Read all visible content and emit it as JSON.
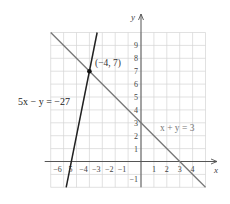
{
  "chart_data": {
    "type": "line",
    "title": "",
    "xlabel": "x",
    "ylabel": "y",
    "xlim": [
      -7,
      5
    ],
    "ylim": [
      -2,
      10
    ],
    "grid": true,
    "x_ticks": [
      -6,
      -5,
      -4,
      -3,
      -2,
      -1,
      1,
      2,
      3,
      4
    ],
    "x_tick_labels": [
      "-6",
      "5",
      "-4",
      "-3",
      "-2",
      "-1",
      "1",
      "2",
      "3",
      "4"
    ],
    "y_ticks": [
      -1,
      1,
      2,
      3,
      4,
      5,
      6,
      7,
      8,
      9
    ],
    "y_tick_labels": [
      "-1",
      "1",
      "2",
      "3",
      "4",
      "5",
      "6",
      "7",
      "8",
      "9"
    ],
    "series": [
      {
        "name": "5x − y = −27",
        "equation": "y = 5x + 27",
        "color": "#222222",
        "points": [
          [
            -5.8,
            -2
          ],
          [
            -3.4,
            10
          ]
        ],
        "label_text": "5x − y = −27"
      },
      {
        "name": "x + y = 3",
        "equation": "y = -x + 3",
        "color": "#777777",
        "points": [
          [
            -7,
            10
          ],
          [
            5,
            -2
          ]
        ],
        "label_text": "x + y = 3"
      }
    ],
    "annotations": [
      {
        "type": "point",
        "x": -4,
        "y": 7,
        "label": "(−4, 7)"
      }
    ]
  },
  "layout": {
    "origin_px": [
      141,
      161.5
    ],
    "unit_px": 12.9
  }
}
